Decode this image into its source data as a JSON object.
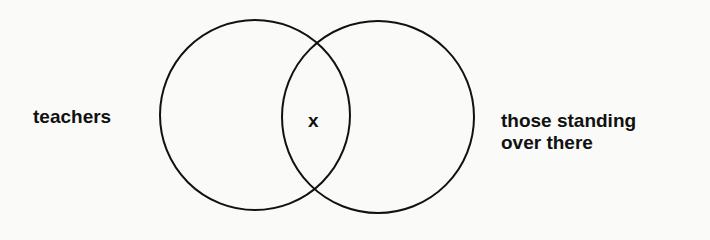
{
  "diagram": {
    "type": "venn",
    "sets": [
      {
        "id": "left",
        "label": "teachers"
      },
      {
        "id": "right",
        "label_line1": "those standing",
        "label_line2": "over there"
      }
    ],
    "intersection_label": "x",
    "colors": {
      "stroke": "#111111",
      "background": "#fafaf8"
    }
  }
}
